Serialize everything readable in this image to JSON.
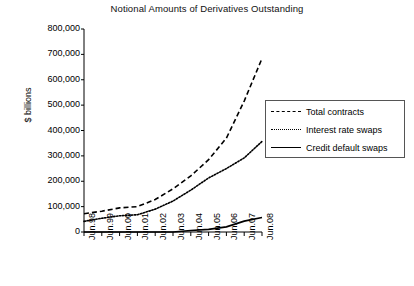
{
  "chart_data": {
    "type": "line",
    "title": "Notional Amounts of Derivatives Outstanding",
    "xlabel": "",
    "ylabel": "$ billions",
    "grid": false,
    "legend_position": "right-upper",
    "ylim": [
      0,
      800000
    ],
    "yticks": [
      0,
      100000,
      200000,
      300000,
      400000,
      500000,
      600000,
      700000,
      800000
    ],
    "ytick_labels": [
      "0",
      "100,000",
      "200,000",
      "300,000",
      "400,000",
      "500,000",
      "600,000",
      "700,000",
      "800,000"
    ],
    "categories": [
      "Jun.98",
      "Jun.99",
      "Jun.00",
      "Jun.01",
      "Jun.02",
      "Jun.03",
      "Jun.04",
      "Jun.05",
      "Jun.06",
      "Jun.07",
      "Jun.08"
    ],
    "series": [
      {
        "name": "Total contracts",
        "style": "dashed",
        "color": "#000000",
        "values": [
          72000,
          82000,
          95000,
          100000,
          128000,
          170000,
          221000,
          285000,
          370000,
          516000,
          684000
        ]
      },
      {
        "name": "Interest rate swaps",
        "style": "dotted",
        "color": "#000000",
        "values": [
          42000,
          54000,
          64000,
          68000,
          90000,
          122000,
          165000,
          213000,
          250000,
          292000,
          357000
        ]
      },
      {
        "name": "Credit default swaps",
        "style": "solid",
        "color": "#000000",
        "values": [
          0,
          0,
          0,
          0,
          0,
          0,
          6000,
          10000,
          20000,
          43000,
          57000
        ]
      }
    ]
  },
  "legend": {
    "items": [
      {
        "label": "Total contracts",
        "style": "dashed"
      },
      {
        "label": "Interest rate swaps",
        "style": "dotted"
      },
      {
        "label": "Credit default swaps",
        "style": "solid"
      }
    ]
  }
}
